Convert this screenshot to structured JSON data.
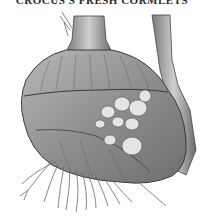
{
  "caption": "CROCUS'S FRESH CORMLETS",
  "illustration": {
    "subject": "corm with cormlets, roots and stem",
    "palette": {
      "light": "#d8d8d8",
      "mid": "#9a9a9a",
      "dark": "#4a4a4a",
      "cormlet": "#e6e6e6"
    }
  }
}
